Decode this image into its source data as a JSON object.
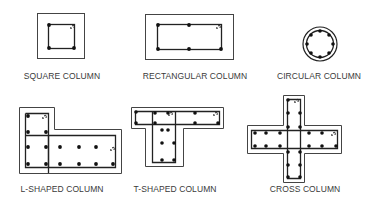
{
  "figure": {
    "colors": {
      "line": "#222222",
      "bar": "#111111",
      "label": "#3a3a3a",
      "background": "#ffffff"
    },
    "columns": [
      {
        "id": "square",
        "label": "SQUARE COLUMN",
        "label_x": 62,
        "label_y": 71
      },
      {
        "id": "rectangular",
        "label": "RECTANGULAR COLUMN",
        "label_x": 195,
        "label_y": 71
      },
      {
        "id": "circular",
        "label": "CIRCULAR COLUMN",
        "label_x": 319,
        "label_y": 71
      },
      {
        "id": "l-shaped",
        "label": "L-SHAPED COLUMN",
        "label_x": 62,
        "label_y": 184
      },
      {
        "id": "t-shaped",
        "label": "T-SHAPED COLUMN",
        "label_x": 175,
        "label_y": 184
      },
      {
        "id": "cross",
        "label": "CROSS COLUMN",
        "label_x": 305,
        "label_y": 184
      }
    ]
  }
}
